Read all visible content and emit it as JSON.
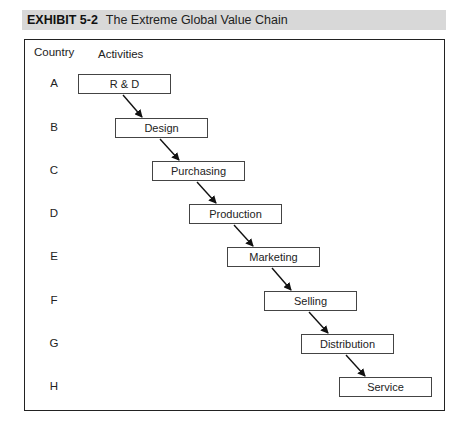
{
  "header": {
    "exhibit_label": "EXHIBIT 5-2",
    "title": "The Extreme Global Value Chain",
    "background_color": "#d8d8d8"
  },
  "diagram": {
    "column_headers": {
      "country": "Country",
      "activities": "Activities"
    },
    "rows": [
      {
        "country": "A",
        "activity": "R & D"
      },
      {
        "country": "B",
        "activity": "Design"
      },
      {
        "country": "C",
        "activity": "Purchasing"
      },
      {
        "country": "D",
        "activity": "Production"
      },
      {
        "country": "E",
        "activity": "Marketing"
      },
      {
        "country": "F",
        "activity": "Selling"
      },
      {
        "country": "G",
        "activity": "Distribution"
      },
      {
        "country": "H",
        "activity": "Service"
      }
    ]
  }
}
